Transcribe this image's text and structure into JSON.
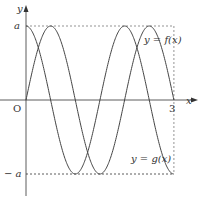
{
  "chart_data": {
    "type": "line",
    "title": "",
    "xlabel": "x",
    "ylabel": "y",
    "origin_label": "O",
    "xlim": [
      0,
      3
    ],
    "ylim": [
      "-a",
      "a"
    ],
    "x_ticks": [
      {
        "value": 3,
        "label": "3"
      }
    ],
    "y_ticks": [
      {
        "value": "a",
        "label": "a"
      },
      {
        "value": "-a",
        "label": "−a"
      }
    ],
    "grid": false,
    "series": [
      {
        "name": "y = f(x)",
        "formula": "a·sin(πx)",
        "x": [
          0,
          0.5,
          1,
          1.5,
          2,
          2.5,
          3
        ],
        "values": [
          0,
          1,
          0,
          -1,
          0,
          1,
          0
        ],
        "units": "a"
      },
      {
        "name": "y = g(x)",
        "formula": "a·cos(πx)",
        "x": [
          0,
          0.5,
          1,
          1.5,
          2,
          2.5,
          3
        ],
        "values": [
          1,
          0,
          -1,
          0,
          1,
          0,
          -1
        ],
        "units": "a"
      }
    ],
    "annotations": [
      "dashed line y=a",
      "dashed line y=-a",
      "dashed line x=3"
    ]
  },
  "labels": {
    "y_axis": "y",
    "x_axis": "x",
    "origin": "O",
    "a": "a",
    "neg_a": "− a",
    "three": "3",
    "f_label": "y = f(x)",
    "g_label": "y = g(x)"
  }
}
